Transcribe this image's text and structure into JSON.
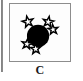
{
  "figure": {
    "panel_label": "C",
    "box": {
      "x": 9,
      "y": 3,
      "width": 62,
      "height": 59,
      "border_color": "#8d8d8d",
      "background": "#fdfdfd"
    },
    "artifact": {
      "name": "scan-edge-line",
      "color": "#6f6f6f"
    },
    "colors": {
      "disk_fill": "#000000",
      "star_stroke": "#000000",
      "star_fill": "#ffffff",
      "caption_color": "#1a1a1a",
      "page_background": "#ffffff"
    },
    "disk": {
      "name": "black-disk",
      "center_x": 38,
      "center_y": 36,
      "radius": 11.5,
      "fill": "#000000"
    },
    "stars": [
      {
        "name": "star-upper-left",
        "center_x": 27.5,
        "center_y": 21.5,
        "radius": 6.0,
        "rotation": -12
      },
      {
        "name": "star-upper-right",
        "center_x": 48.5,
        "center_y": 21.5,
        "radius": 5.8,
        "rotation": 10
      },
      {
        "name": "star-right",
        "center_x": 53.5,
        "center_y": 29.5,
        "radius": 5.4,
        "rotation": -6
      },
      {
        "name": "star-lower-left",
        "center_x": 26.5,
        "center_y": 44.5,
        "radius": 5.6,
        "rotation": 8
      },
      {
        "name": "star-bottom",
        "center_x": 35.5,
        "center_y": 49.5,
        "radius": 5.6,
        "rotation": -4
      }
    ],
    "star_count": 5
  }
}
